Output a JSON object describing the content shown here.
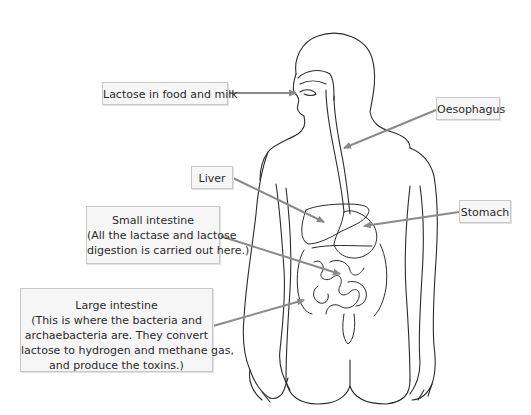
{
  "diagram": {
    "figure": "human torso outline with digestive tract",
    "colors": {
      "outline": "#2b2b2b",
      "arrow": "#8a8a8a",
      "label_background": "#f6f6f6",
      "label_border": "#c8c8c8",
      "label_text": "#2a2a2a"
    },
    "labels": {
      "lactose": {
        "lines": [
          "Lactose in food and milk"
        ],
        "points_to": "mouth"
      },
      "oesophagus": {
        "lines": [
          "Oesophagus"
        ],
        "points_to": "oesophagus"
      },
      "liver": {
        "lines": [
          "Liver"
        ],
        "points_to": "liver"
      },
      "stomach": {
        "lines": [
          "Stomach"
        ],
        "points_to": "stomach"
      },
      "small_intestine": {
        "lines": [
          "Small intestine",
          "(All the lactase and lactose",
          "digestion is carried out here.)"
        ],
        "points_to": "small intestine"
      },
      "large_intestine": {
        "lines": [
          "Large intestine",
          "(This is where the bacteria and",
          "archaebacteria are. They convert",
          "lactose to hydrogen and methane gas,",
          "and produce the toxins.)"
        ],
        "points_to": "large intestine"
      }
    }
  }
}
